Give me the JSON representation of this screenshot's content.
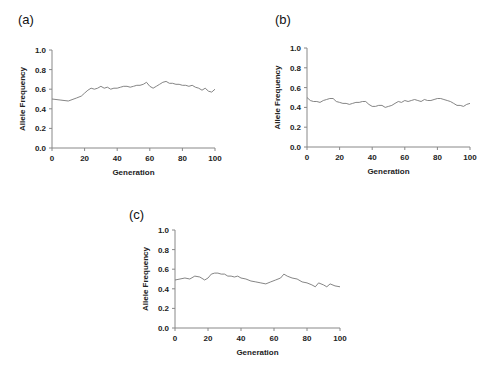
{
  "chart_data": [
    {
      "type": "line",
      "panel_label": "(a)",
      "title": "",
      "xlabel": "Generation",
      "ylabel": "Allele Frequency",
      "xlim": [
        0,
        100
      ],
      "ylim": [
        0.0,
        1.0
      ],
      "xticks": [
        "0",
        "20",
        "40",
        "60",
        "80",
        "100"
      ],
      "yticks": [
        "0.0",
        "0.2",
        "0.4",
        "0.6",
        "0.8",
        "1.0"
      ],
      "grid": false,
      "legend": null,
      "x": [
        0,
        5,
        10,
        15,
        18,
        20,
        22,
        24,
        26,
        28,
        30,
        32,
        34,
        36,
        38,
        40,
        42,
        44,
        46,
        48,
        50,
        52,
        54,
        56,
        58,
        60,
        62,
        64,
        66,
        68,
        70,
        72,
        74,
        76,
        78,
        80,
        82,
        84,
        86,
        88,
        90,
        92,
        94,
        96,
        98,
        100
      ],
      "series": [
        {
          "name": "Allele Frequency",
          "values": [
            0.5,
            0.49,
            0.48,
            0.51,
            0.53,
            0.56,
            0.59,
            0.61,
            0.6,
            0.61,
            0.63,
            0.61,
            0.62,
            0.6,
            0.61,
            0.61,
            0.62,
            0.63,
            0.63,
            0.62,
            0.63,
            0.64,
            0.64,
            0.65,
            0.67,
            0.63,
            0.61,
            0.63,
            0.65,
            0.67,
            0.68,
            0.66,
            0.66,
            0.65,
            0.65,
            0.64,
            0.64,
            0.63,
            0.64,
            0.62,
            0.61,
            0.59,
            0.61,
            0.58,
            0.57,
            0.6
          ]
        }
      ]
    },
    {
      "type": "line",
      "panel_label": "(b)",
      "title": "",
      "xlabel": "Generation",
      "ylabel": "Allele Frequency",
      "xlim": [
        0,
        100
      ],
      "ylim": [
        0.0,
        1.0
      ],
      "xticks": [
        "0",
        "20",
        "40",
        "60",
        "80",
        "100"
      ],
      "yticks": [
        "0.0",
        "0.2",
        "0.4",
        "0.6",
        "0.8",
        "1.0"
      ],
      "grid": false,
      "legend": null,
      "x": [
        0,
        2,
        4,
        6,
        8,
        10,
        12,
        14,
        16,
        18,
        20,
        22,
        24,
        26,
        28,
        30,
        32,
        34,
        36,
        38,
        40,
        42,
        44,
        46,
        48,
        50,
        52,
        54,
        56,
        58,
        60,
        62,
        64,
        66,
        68,
        70,
        72,
        74,
        76,
        78,
        80,
        82,
        84,
        86,
        88,
        90,
        92,
        94,
        96,
        98,
        100
      ],
      "series": [
        {
          "name": "Allele Frequency",
          "values": [
            0.5,
            0.47,
            0.46,
            0.46,
            0.45,
            0.47,
            0.48,
            0.49,
            0.49,
            0.46,
            0.45,
            0.44,
            0.44,
            0.43,
            0.44,
            0.45,
            0.45,
            0.46,
            0.46,
            0.43,
            0.41,
            0.41,
            0.42,
            0.42,
            0.4,
            0.41,
            0.42,
            0.44,
            0.46,
            0.45,
            0.47,
            0.46,
            0.47,
            0.48,
            0.47,
            0.46,
            0.48,
            0.47,
            0.47,
            0.48,
            0.49,
            0.49,
            0.48,
            0.47,
            0.46,
            0.44,
            0.42,
            0.42,
            0.41,
            0.43,
            0.44
          ]
        }
      ]
    },
    {
      "type": "line",
      "panel_label": "(c)",
      "title": "",
      "xlabel": "Generation",
      "ylabel": "Allele Frequency",
      "xlim": [
        0,
        100
      ],
      "ylim": [
        0.0,
        1.0
      ],
      "xticks": [
        "0",
        "20",
        "40",
        "60",
        "80",
        "100"
      ],
      "yticks": [
        "0.0",
        "0.2",
        "0.4",
        "0.6",
        "0.8",
        "1.0"
      ],
      "grid": false,
      "legend": null,
      "x": [
        0,
        3,
        6,
        9,
        12,
        15,
        18,
        20,
        22,
        24,
        26,
        28,
        30,
        32,
        34,
        36,
        38,
        40,
        43,
        46,
        49,
        52,
        55,
        58,
        61,
        64,
        66,
        68,
        71,
        74,
        77,
        80,
        83,
        85,
        87,
        90,
        92,
        94,
        97,
        100
      ],
      "series": [
        {
          "name": "Allele Frequency",
          "values": [
            0.49,
            0.5,
            0.51,
            0.5,
            0.53,
            0.52,
            0.49,
            0.51,
            0.55,
            0.56,
            0.56,
            0.55,
            0.55,
            0.53,
            0.53,
            0.52,
            0.53,
            0.51,
            0.5,
            0.48,
            0.47,
            0.46,
            0.45,
            0.47,
            0.49,
            0.51,
            0.55,
            0.53,
            0.51,
            0.5,
            0.47,
            0.46,
            0.44,
            0.42,
            0.46,
            0.44,
            0.42,
            0.45,
            0.43,
            0.42
          ]
        }
      ]
    }
  ]
}
